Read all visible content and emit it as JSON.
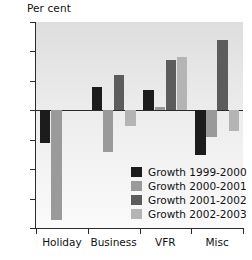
{
  "chart_data": {
    "type": "bar",
    "title": "",
    "subtitle": "",
    "xlabel": "",
    "ylabel": "Per cent",
    "ylim": [
      -20,
      15
    ],
    "yticks": [
      15,
      10,
      5,
      0,
      -5,
      -10,
      -15,
      -20
    ],
    "ytick_labels": [
      "15",
      "10",
      "5",
      "0",
      "–5",
      "–10",
      "–15",
      "–20"
    ],
    "grid": false,
    "legend_position": "inside-lower-right",
    "categories": [
      "Holiday",
      "Business",
      "VFR",
      "Misc"
    ],
    "series": [
      {
        "name": "Growth 1999-2000",
        "color": "#1c1c1c",
        "values": [
          -5.5,
          4.0,
          3.5,
          -7.6
        ]
      },
      {
        "name": "Growth 2000-2001",
        "color": "#9a9a9a",
        "values": [
          -18.6,
          -7.1,
          0.5,
          -4.6
        ]
      },
      {
        "name": "Growth 2001-2002",
        "color": "#5c5c5c",
        "values": [
          0.0,
          6.0,
          8.5,
          12.0
        ]
      },
      {
        "name": "Growth 2002-2003",
        "color": "#b4b4b4",
        "values": [
          0.0,
          -2.7,
          9.0,
          -3.6
        ]
      }
    ]
  },
  "axis": {
    "y_title": "Per cent"
  },
  "legend": {
    "entries": [
      {
        "label": "Growth 1999-2000",
        "color": "#1c1c1c"
      },
      {
        "label": "Growth 2000-2001",
        "color": "#9a9a9a"
      },
      {
        "label": "Growth 2001-2002",
        "color": "#5c5c5c"
      },
      {
        "label": "Growth 2002-2003",
        "color": "#b4b4b4"
      }
    ]
  }
}
